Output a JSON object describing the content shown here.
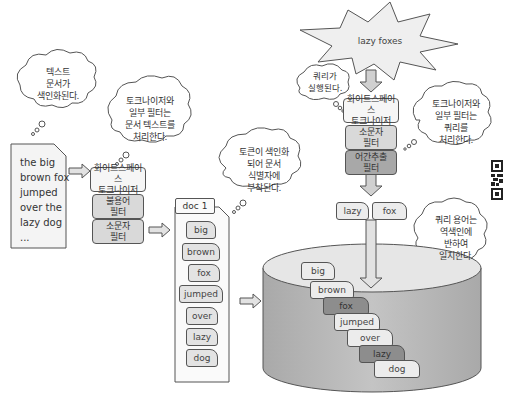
{
  "document": {
    "lines": "the big\nbrown fox\njumped\nover the\nlazy dog\n..."
  },
  "clouds": {
    "text_indexed": "텍스트\n문서가\n색인화된다.",
    "tokenizer_doc": "토크나이저와\n일부 필터는\n문서 텍스트를\n처리한다.",
    "tokens_indexed": "토큰이 색인화\n되어 문서\n식별자에\n부착된다.",
    "query_executed": "쿼리가\n실행된다.",
    "tokenizer_query": "토크나이저와\n일부 필터는\n쿼리를\n처리한다.",
    "query_match": "쿼리 용어는\n역색인에\n반하여\n일치한다."
  },
  "index_pipeline": {
    "steps": [
      {
        "label": "화이트스페이스\n토크나이저",
        "shade": "light"
      },
      {
        "label": "불용어\n필터",
        "shade": "mid"
      },
      {
        "label": "소문자\n필터",
        "shade": "mid"
      }
    ]
  },
  "doc_card": {
    "title": "doc 1",
    "tokens": [
      "big",
      "brown",
      "fox",
      "jumped",
      "over",
      "lazy",
      "dog"
    ]
  },
  "query": {
    "text": "lazy foxes",
    "steps": [
      {
        "label": "화이트스페이스\n토크나이저",
        "shade": "light"
      },
      {
        "label": "소문자\n필터",
        "shade": "mid"
      },
      {
        "label": "어간추출\n필터",
        "shade": "dark"
      }
    ],
    "terms": [
      "lazy",
      "fox"
    ]
  },
  "index_store": {
    "tokens": [
      {
        "label": "big",
        "matched": false
      },
      {
        "label": "brown",
        "matched": false
      },
      {
        "label": "fox",
        "matched": true
      },
      {
        "label": "jumped",
        "matched": false
      },
      {
        "label": "over",
        "matched": false
      },
      {
        "label": "lazy",
        "matched": true
      },
      {
        "label": "dog",
        "matched": false
      }
    ]
  },
  "colors": {
    "outline": "#555555",
    "light_fill": "#f6f6f6",
    "mid_fill": "#d9d9d9",
    "dark_fill": "#a8a8a8",
    "cylinder_side": "#bdbdbd",
    "cylinder_top": "#e6e6e6"
  }
}
